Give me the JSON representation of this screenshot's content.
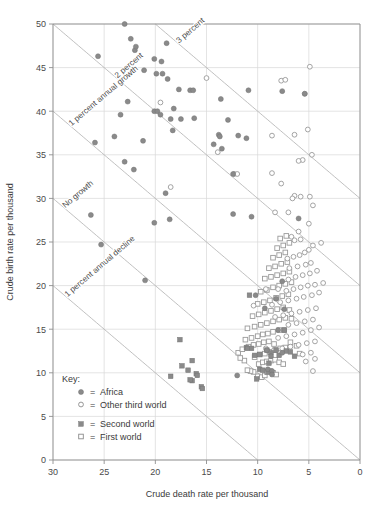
{
  "chart_data": {
    "type": "scatter",
    "title": "",
    "xlabel": "Crude death rate per thousand",
    "ylabel": "Crude birth rate per thousand",
    "xlim": [
      30,
      0
    ],
    "ylim": [
      0,
      50
    ],
    "x_reversed": true,
    "xticks": [
      30,
      25,
      20,
      15,
      10,
      5,
      0
    ],
    "yticks": [
      0,
      5,
      10,
      15,
      20,
      25,
      30,
      35,
      40,
      45,
      50
    ],
    "grid": true,
    "legend_position": "lower-left-inside",
    "legend_title": "Key:",
    "reference_lines": [
      {
        "label": "3 percent",
        "rate": 30,
        "marker": "3-percent"
      },
      {
        "label": "2 percent",
        "rate": 20,
        "marker": "2-percent"
      },
      {
        "label": "1 percent annual growth",
        "rate": 10,
        "marker": "1-percent-growth"
      },
      {
        "label": "No growth",
        "rate": 0,
        "marker": "no-growth"
      },
      {
        "label": "1 percent annual decline",
        "rate": -10,
        "marker": "1-percent-decline"
      }
    ],
    "series": [
      {
        "name": "Africa",
        "marker": "filled-circle",
        "color": "#8a8a8a",
        "points": [
          [
            23.0,
            50.0
          ],
          [
            25.6,
            46.3
          ],
          [
            22.4,
            48.3
          ],
          [
            22.0,
            47.0
          ],
          [
            21.9,
            47.4
          ],
          [
            18.9,
            47.8
          ],
          [
            19.4,
            45.7
          ],
          [
            20.1,
            46.0
          ],
          [
            21.1,
            44.7
          ],
          [
            19.9,
            44.3
          ],
          [
            19.3,
            44.3
          ],
          [
            22.7,
            41.1
          ],
          [
            18.8,
            43.7
          ],
          [
            17.7,
            42.5
          ],
          [
            16.6,
            42.4
          ],
          [
            16.3,
            42.4
          ],
          [
            10.9,
            42.4
          ],
          [
            13.6,
            41.4
          ],
          [
            23.4,
            39.6
          ],
          [
            20.1,
            40.0
          ],
          [
            19.8,
            40.0
          ],
          [
            19.5,
            39.6
          ],
          [
            18.2,
            40.3
          ],
          [
            18.5,
            39.1
          ],
          [
            17.5,
            39.1
          ],
          [
            16.2,
            39.2
          ],
          [
            12.9,
            39.0
          ],
          [
            18.3,
            37.8
          ],
          [
            13.8,
            37.3
          ],
          [
            13.7,
            37.1
          ],
          [
            11.9,
            37.2
          ],
          [
            24.0,
            37.1
          ],
          [
            11.1,
            36.9
          ],
          [
            21.2,
            36.6
          ],
          [
            14.3,
            36.2
          ],
          [
            13.5,
            35.7
          ],
          [
            25.9,
            36.4
          ],
          [
            23.0,
            34.2
          ],
          [
            22.1,
            33.3
          ],
          [
            19.0,
            30.6
          ],
          [
            12.4,
            32.8
          ],
          [
            26.3,
            28.1
          ],
          [
            20.1,
            27.2
          ],
          [
            18.6,
            27.6
          ],
          [
            12.4,
            28.2
          ],
          [
            10.6,
            27.9
          ],
          [
            6.0,
            27.7
          ],
          [
            25.3,
            24.7
          ],
          [
            21.0,
            20.6
          ],
          [
            10.2,
            18.9
          ],
          [
            9.3,
            17.4
          ],
          [
            7.4,
            17.3
          ],
          [
            7.6,
            20.5
          ],
          [
            8.2,
            18.5
          ],
          [
            8.0,
            14.9
          ],
          [
            9.1,
            12.6
          ],
          [
            8.7,
            11.9
          ],
          [
            7.6,
            12.3
          ],
          [
            9.0,
            10.4
          ],
          [
            8.6,
            10.2
          ],
          [
            8.6,
            9.8
          ],
          [
            12.0,
            9.7
          ],
          [
            5.4,
            42.0
          ],
          [
            7.6,
            42.3
          ]
        ]
      },
      {
        "name": "Other third world",
        "marker": "open-circle",
        "color": "#9a9a9a",
        "points": [
          [
            19.5,
            41.0
          ],
          [
            4.9,
            45.1
          ],
          [
            5.4,
            42.0
          ],
          [
            7.7,
            43.5
          ],
          [
            7.3,
            43.6
          ],
          [
            15.0,
            43.8
          ],
          [
            5.1,
            37.9
          ],
          [
            6.4,
            37.3
          ],
          [
            8.6,
            37.2
          ],
          [
            13.9,
            35.3
          ],
          [
            4.7,
            35.0
          ],
          [
            5.6,
            34.4
          ],
          [
            6.0,
            34.3
          ],
          [
            12.3,
            32.8
          ],
          [
            12.0,
            32.8
          ],
          [
            8.6,
            32.9
          ],
          [
            7.7,
            31.7
          ],
          [
            18.5,
            31.3
          ],
          [
            6.4,
            30.3
          ],
          [
            5.8,
            30.2
          ],
          [
            4.9,
            30.2
          ],
          [
            6.6,
            30.0
          ],
          [
            8.3,
            28.4
          ],
          [
            7.0,
            28.4
          ],
          [
            4.6,
            29.2
          ],
          [
            5.0,
            27.1
          ],
          [
            6.0,
            26.2
          ],
          [
            6.7,
            25.6
          ],
          [
            6.4,
            25.2
          ],
          [
            3.8,
            24.9
          ],
          [
            5.8,
            25.3
          ],
          [
            4.6,
            24.6
          ],
          [
            5.0,
            24.1
          ],
          [
            5.4,
            23.8
          ],
          [
            5.9,
            23.5
          ],
          [
            6.5,
            23.3
          ],
          [
            7.1,
            23.1
          ],
          [
            4.8,
            22.6
          ],
          [
            5.3,
            22.4
          ],
          [
            6.1,
            22.2
          ],
          [
            6.9,
            22.0
          ],
          [
            4.2,
            21.7
          ],
          [
            4.9,
            21.4
          ],
          [
            5.6,
            21.2
          ],
          [
            6.3,
            21.0
          ],
          [
            7.0,
            20.7
          ],
          [
            3.6,
            20.3
          ],
          [
            4.4,
            20.1
          ],
          [
            5.1,
            20.0
          ],
          [
            5.8,
            19.8
          ],
          [
            6.5,
            19.6
          ],
          [
            7.2,
            19.4
          ],
          [
            8.0,
            19.6
          ],
          [
            9.2,
            19.6
          ],
          [
            4.0,
            19.2
          ],
          [
            4.7,
            18.9
          ],
          [
            5.5,
            18.7
          ],
          [
            6.2,
            18.5
          ],
          [
            7.0,
            18.3
          ],
          [
            7.8,
            18.1
          ],
          [
            8.6,
            17.8
          ],
          [
            10.4,
            17.7
          ],
          [
            4.3,
            17.4
          ],
          [
            5.1,
            17.2
          ],
          [
            5.9,
            17.0
          ],
          [
            6.7,
            16.8
          ],
          [
            7.5,
            16.6
          ],
          [
            8.3,
            16.4
          ],
          [
            4.6,
            16.1
          ],
          [
            5.4,
            15.9
          ],
          [
            6.2,
            15.7
          ],
          [
            7.0,
            15.5
          ],
          [
            4.0,
            15.2
          ],
          [
            4.8,
            14.9
          ],
          [
            5.6,
            14.6
          ],
          [
            6.4,
            14.4
          ],
          [
            7.2,
            14.2
          ],
          [
            8.0,
            14.0
          ],
          [
            4.4,
            13.6
          ],
          [
            5.2,
            13.4
          ],
          [
            6.0,
            13.2
          ],
          [
            6.8,
            13.0
          ],
          [
            7.6,
            12.8
          ],
          [
            8.4,
            12.6
          ],
          [
            9.2,
            12.8
          ],
          [
            4.8,
            12.3
          ],
          [
            5.6,
            12.1
          ],
          [
            4.4,
            11.6
          ],
          [
            5.3,
            11.3
          ],
          [
            4.6,
            10.2
          ]
        ]
      },
      {
        "name": "Second world",
        "marker": "filled-square",
        "color": "#8a8a8a",
        "points": [
          [
            16.4,
            11.4
          ],
          [
            16.0,
            9.9
          ],
          [
            15.9,
            9.7
          ],
          [
            15.5,
            8.4
          ],
          [
            15.4,
            8.2
          ],
          [
            16.4,
            9.1
          ],
          [
            16.6,
            9.2
          ],
          [
            16.8,
            10.3
          ],
          [
            17.4,
            10.8
          ],
          [
            18.5,
            9.6
          ],
          [
            17.6,
            13.8
          ],
          [
            10.8,
            18.9
          ],
          [
            11.1,
            12.9
          ],
          [
            11.0,
            12.8
          ],
          [
            10.6,
            12.8
          ],
          [
            10.3,
            12.0
          ],
          [
            9.8,
            12.1
          ],
          [
            9.1,
            12.6
          ],
          [
            9.8,
            10.4
          ],
          [
            9.5,
            10.3
          ],
          [
            9.0,
            10.1
          ],
          [
            8.7,
            12.3
          ],
          [
            8.2,
            12.6
          ],
          [
            7.9,
            12.0
          ],
          [
            7.2,
            12.5
          ],
          [
            10.1,
            9.3
          ],
          [
            7.4,
            14.9
          ],
          [
            6.8,
            12.4
          ],
          [
            6.4,
            11.9
          ],
          [
            8.9,
            11.1
          ]
        ]
      },
      {
        "name": "First world",
        "marker": "open-square",
        "color": "#9a9a9a",
        "points": [
          [
            10.0,
            9.6
          ],
          [
            9.6,
            9.5
          ],
          [
            9.3,
            9.7
          ],
          [
            9.1,
            10.1
          ],
          [
            8.8,
            10.2
          ],
          [
            8.5,
            10.0
          ],
          [
            8.2,
            9.8
          ],
          [
            10.4,
            10.1
          ],
          [
            10.7,
            10.2
          ],
          [
            11.0,
            10.3
          ],
          [
            9.9,
            11.0
          ],
          [
            9.5,
            11.2
          ],
          [
            9.1,
            11.3
          ],
          [
            8.7,
            11.4
          ],
          [
            8.3,
            11.5
          ],
          [
            7.9,
            11.2
          ],
          [
            7.5,
            11.0
          ],
          [
            11.3,
            11.4
          ],
          [
            11.7,
            11.7
          ],
          [
            10.3,
            11.8
          ],
          [
            9.8,
            12.1
          ],
          [
            9.3,
            12.2
          ],
          [
            8.8,
            12.4
          ],
          [
            8.3,
            12.6
          ],
          [
            7.8,
            12.8
          ],
          [
            7.3,
            12.9
          ],
          [
            11.9,
            12.3
          ],
          [
            11.5,
            12.7
          ],
          [
            10.9,
            13.0
          ],
          [
            10.4,
            13.2
          ],
          [
            9.9,
            13.3
          ],
          [
            9.4,
            13.5
          ],
          [
            8.9,
            13.6
          ],
          [
            8.4,
            13.3
          ],
          [
            6.8,
            13.5
          ],
          [
            6.2,
            13.1
          ],
          [
            11.2,
            13.8
          ],
          [
            10.6,
            14.0
          ],
          [
            10.0,
            14.2
          ],
          [
            9.5,
            14.4
          ],
          [
            9.0,
            14.5
          ],
          [
            8.5,
            14.7
          ],
          [
            7.9,
            14.9
          ],
          [
            7.4,
            14.9
          ],
          [
            5.9,
            12.2
          ],
          [
            11.0,
            15.1
          ],
          [
            10.3,
            15.3
          ],
          [
            9.7,
            15.5
          ],
          [
            9.1,
            15.7
          ],
          [
            8.5,
            15.9
          ],
          [
            7.9,
            16.1
          ],
          [
            7.3,
            16.3
          ],
          [
            6.7,
            16.2
          ],
          [
            10.5,
            16.5
          ],
          [
            9.9,
            16.7
          ],
          [
            9.3,
            16.9
          ],
          [
            8.7,
            17.1
          ],
          [
            8.1,
            17.3
          ],
          [
            7.5,
            17.5
          ],
          [
            6.9,
            17.2
          ],
          [
            10.0,
            17.9
          ],
          [
            9.4,
            18.1
          ],
          [
            8.8,
            18.3
          ],
          [
            8.2,
            18.6
          ],
          [
            7.6,
            18.8
          ],
          [
            7.0,
            19.0
          ],
          [
            9.7,
            19.3
          ],
          [
            9.1,
            19.5
          ],
          [
            8.5,
            19.8
          ],
          [
            7.9,
            20.0
          ],
          [
            7.3,
            20.2
          ],
          [
            6.7,
            20.4
          ],
          [
            9.3,
            20.8
          ],
          [
            8.7,
            21.0
          ],
          [
            8.1,
            21.2
          ],
          [
            7.5,
            21.4
          ],
          [
            6.9,
            21.6
          ],
          [
            8.9,
            22.0
          ],
          [
            8.3,
            22.2
          ],
          [
            7.7,
            22.5
          ],
          [
            7.1,
            22.7
          ],
          [
            8.5,
            23.2
          ],
          [
            7.9,
            23.5
          ],
          [
            7.3,
            23.8
          ],
          [
            8.1,
            24.3
          ],
          [
            7.5,
            24.6
          ],
          [
            6.9,
            24.9
          ],
          [
            7.8,
            25.4
          ],
          [
            7.2,
            25.7
          ]
        ]
      }
    ]
  },
  "axes": {
    "x_title": "Crude death rate per thousand",
    "y_title": "Crude birth rate per thousand",
    "x_ticks": [
      "30",
      "25",
      "20",
      "15",
      "10",
      "5",
      "0"
    ],
    "y_ticks": [
      "0",
      "5",
      "10",
      "15",
      "20",
      "25",
      "30",
      "35",
      "40",
      "45",
      "50"
    ]
  },
  "reference_labels": {
    "three_percent": "3 percent",
    "two_percent": "2 percent",
    "one_percent_growth": "1 percent annual growth",
    "no_growth": "No growth",
    "one_percent_decline": "1 percent annual decline"
  },
  "legend": {
    "title": "Key:",
    "equals": "=",
    "items": [
      {
        "label": "Africa",
        "marker": "filled-circle"
      },
      {
        "label": "Other third world",
        "marker": "open-circle"
      },
      {
        "label": "Second world",
        "marker": "filled-square"
      },
      {
        "label": "First world",
        "marker": "open-square"
      }
    ]
  },
  "colors": {
    "marker_fill": "#8a8a8a",
    "marker_stroke": "#9a9a9a",
    "grid": "#d8d8d8",
    "axis": "#8f8f8f",
    "refline": "#b0b0b0",
    "text": "#3a3a3a"
  }
}
